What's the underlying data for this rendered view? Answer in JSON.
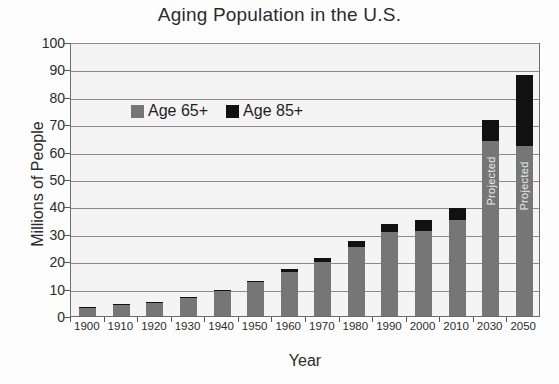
{
  "chart_data": {
    "type": "bar",
    "subtype": "stacked-bar",
    "title": "Aging Population in the U.S.",
    "xlabel": "Year",
    "ylabel": "Millions of People",
    "ylim": [
      0,
      100
    ],
    "ytick_step": 10,
    "yticks": [
      "100",
      "90",
      "80",
      "70",
      "60",
      "50",
      "40",
      "30",
      "20",
      "10",
      "0"
    ],
    "grid": true,
    "legend_position": "inside-upper-left",
    "categories": [
      "1900",
      "1910",
      "1920",
      "1930",
      "1940",
      "1950",
      "1960",
      "1970",
      "1980",
      "1990",
      "2000",
      "2010",
      "2030",
      "2050"
    ],
    "series": [
      {
        "name": "Age 65+",
        "color": "#767676",
        "values": [
          3.1,
          3.9,
          4.9,
          6.6,
          9.0,
          12.3,
          16.2,
          19.8,
          25.1,
          30.6,
          31.0,
          35.1,
          64.0,
          62.0
        ]
      },
      {
        "name": "Age 85+",
        "color": "#111111",
        "values": [
          0.1,
          0.2,
          0.2,
          0.3,
          0.4,
          0.6,
          0.9,
          1.4,
          2.2,
          3.0,
          4.2,
          4.3,
          7.5,
          26.0
        ]
      }
    ],
    "totals": [
      3.1,
      4.0,
      4.9,
      6.8,
      9.0,
      12.4,
      16.6,
      20.1,
      25.5,
      31.2,
      35.0,
      39.4,
      71.5,
      88.0
    ],
    "annotations": [
      {
        "category": "2030",
        "text": "Projected",
        "orientation": "vertical"
      },
      {
        "category": "2050",
        "text": "Projected",
        "orientation": "vertical"
      }
    ]
  },
  "legend": {
    "items": [
      {
        "label": "Age 65+",
        "color": "#767676"
      },
      {
        "label": "Age 85+",
        "color": "#111111"
      }
    ]
  },
  "colors": {
    "age_65_plus": "#767676",
    "age_85_plus": "#111111",
    "grid": "#8a8a8a",
    "axis": "#6d6d6d",
    "plot_background": "#f4f4f4"
  }
}
